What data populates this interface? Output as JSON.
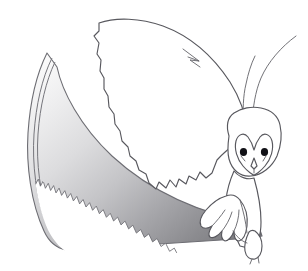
{
  "artwork": {
    "title": "Barn Owl Carrying a Curved Saw Blade",
    "subject": "owl-in-flight-with-saw",
    "style": "line-art-illustration",
    "medium": "black-outline-with-grayscale-gradient-fill",
    "canvas": {
      "width": 308,
      "height": 271
    },
    "background_color": "#ffffff",
    "outline_color": "#58585e",
    "caption": ""
  },
  "palette": {
    "background": "#ffffff",
    "outline": "#58585e",
    "outline_thin": "#6a6a70",
    "body_fill": "#ffffff",
    "eye_fill": "#111116",
    "blade_light": "#f3f3f3",
    "blade_mid": "#c9c9cb",
    "blade_dark": "#7d7d81",
    "blade_darkest": "#6f6f73",
    "blade_edge": "#6d6d73"
  },
  "elements": [
    {
      "name": "saw-blade",
      "label": "Large curved saw blade",
      "description": "Crescent-shaped blade sweeping from upper-left tip down to lower-right, filled with a diagonal gray gradient and edged with sawteeth along its lower-left curve.",
      "fill": "gradient light-to-dark",
      "teeth_count": 44
    },
    {
      "name": "blade-spine",
      "label": "Blade spine double line",
      "description": "Thin secondary outline tracing inside the blade's upper-left back edge."
    },
    {
      "name": "saw-teeth",
      "label": "Saw teeth",
      "description": "Row of small triangular teeth along the concave lower edge of the blade."
    },
    {
      "name": "owl-left-wing",
      "label": "Owl raised wing",
      "description": "Large upswept wing with a jagged, stepped trailing edge of primary feather tips, white interior.",
      "fill": "#ffffff"
    },
    {
      "name": "owl-wing-notch",
      "label": "Wing fold notch",
      "description": "Small pointed hook mark where the wing leading edge folds."
    },
    {
      "name": "owl-far-wing",
      "label": "Owl far wing edge",
      "description": "Two thin curved lines rising to the upper-right behind the head, suggesting the opposite wing."
    },
    {
      "name": "owl-head",
      "label": "Owl head",
      "description": "Rounded barn-owl head with heart-shaped facial disc."
    },
    {
      "name": "owl-facial-disc",
      "label": "Heart-shaped facial disc",
      "description": "Characteristic barn owl heart outline framing the eyes and beak."
    },
    {
      "name": "owl-eye-left",
      "label": "Left eye",
      "description": "Solid black round eye.",
      "fill": "#111116"
    },
    {
      "name": "owl-eye-right",
      "label": "Right eye",
      "description": "Solid black round eye.",
      "fill": "#111116"
    },
    {
      "name": "owl-beak",
      "label": "Beak",
      "description": "Small downward V beak between and below the eyes."
    },
    {
      "name": "owl-body",
      "label": "Owl body and chest",
      "description": "Narrow white body descending from head to legs."
    },
    {
      "name": "owl-talon-gripping",
      "label": "Gripping talon",
      "description": "Front foot with four clawed toes curled over the top edge of the saw blade."
    },
    {
      "name": "owl-leg-rear",
      "label": "Rear leg and foot",
      "description": "Second leg hanging down with a smaller foot and claws."
    }
  ],
  "annotations": {
    "labels": [],
    "text_present": false
  }
}
